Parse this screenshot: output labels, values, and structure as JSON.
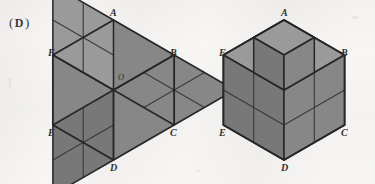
{
  "page": {
    "width": 375,
    "height": 184,
    "background_color": "#f7f6f4",
    "kind": "textbook-geometry-figure"
  },
  "choice": {
    "open_paren": "(",
    "letter": "D",
    "close_paren": ")",
    "full_text": "( D )"
  },
  "colors": {
    "face_fill": "#878787",
    "face_fill_light": "#9a9a9a",
    "face_fill_dark": "#787878",
    "outline": "#262626",
    "inner_line": "#3a3a3a",
    "label_color": "#2f2f2f",
    "paper": "#f7f6f4"
  },
  "figures": [
    {
      "id": "left-figure",
      "name": "hexagon-rhombi-tiling",
      "description": "Regular hexagon ABCDEF subdivided into three large rhombi meeting at center O; each large rhombus is further divided into four small rhombi",
      "center": {
        "x": 113.5,
        "y": 90,
        "label": "O"
      },
      "radius": 70,
      "vertices": [
        {
          "label": "A",
          "angle_deg": 90,
          "lx": 110,
          "ly": 8
        },
        {
          "label": "B",
          "angle_deg": 30,
          "lx": 170,
          "ly": 48
        },
        {
          "label": "C",
          "angle_deg": -30,
          "lx": 170,
          "ly": 128
        },
        {
          "label": "D",
          "angle_deg": -90,
          "lx": 110,
          "ly": 163
        },
        {
          "label": "E",
          "angle_deg": -150,
          "lx": 48,
          "ly": 128
        },
        {
          "label": "F",
          "angle_deg": 150,
          "lx": 48,
          "ly": 48
        }
      ],
      "subdivisions": 2,
      "rhombi_count": 12
    },
    {
      "id": "right-figure",
      "name": "isometric-cube-stack",
      "description": "Isometric 2x2x2 cube ABCDEF with a unit cube protruding at the near top corner",
      "center": {
        "x": 284,
        "y": 90
      },
      "radius": 70,
      "vertices": [
        {
          "label": "A",
          "angle_deg": 90,
          "lx": 281,
          "ly": 8
        },
        {
          "label": "B",
          "angle_deg": 30,
          "lx": 341,
          "ly": 48
        },
        {
          "label": "C",
          "angle_deg": -30,
          "lx": 341,
          "ly": 128
        },
        {
          "label": "D",
          "angle_deg": -90,
          "lx": 281,
          "ly": 163
        },
        {
          "label": "E",
          "angle_deg": -150,
          "lx": 219,
          "ly": 128
        },
        {
          "label": "F",
          "angle_deg": 150,
          "lx": 219,
          "ly": 48
        }
      ],
      "subdivisions": 2,
      "visible_faces": 12
    }
  ]
}
